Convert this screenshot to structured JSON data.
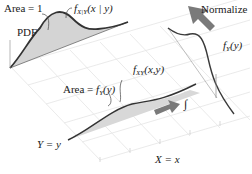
{
  "diagram": {
    "labels": {
      "area_one": "Area = 1",
      "pdf": "PDF",
      "conditional_f": "f",
      "conditional_sub": "X|Y",
      "conditional_args": "(x | y)",
      "normalize": "Normalize",
      "marginal_f": "f",
      "marginal_sub": "Y",
      "marginal_args": "(y)",
      "area_fy_prefix": "Area = ",
      "area_fy_f": "f",
      "area_fy_sub": "Y",
      "area_fy_args": "(y)",
      "joint_f": "f",
      "joint_sub": "XY",
      "joint_args": "(x,y)",
      "y_axis": "Y = y",
      "x_axis": "X = x",
      "integral_symbol": "∫"
    },
    "colors": {
      "curve": "#3a3a3a",
      "fill": "#d4d4d4",
      "grid": "#e6e6e6",
      "arrow": "#7a7a7a",
      "text": "#1a1a1a"
    }
  }
}
